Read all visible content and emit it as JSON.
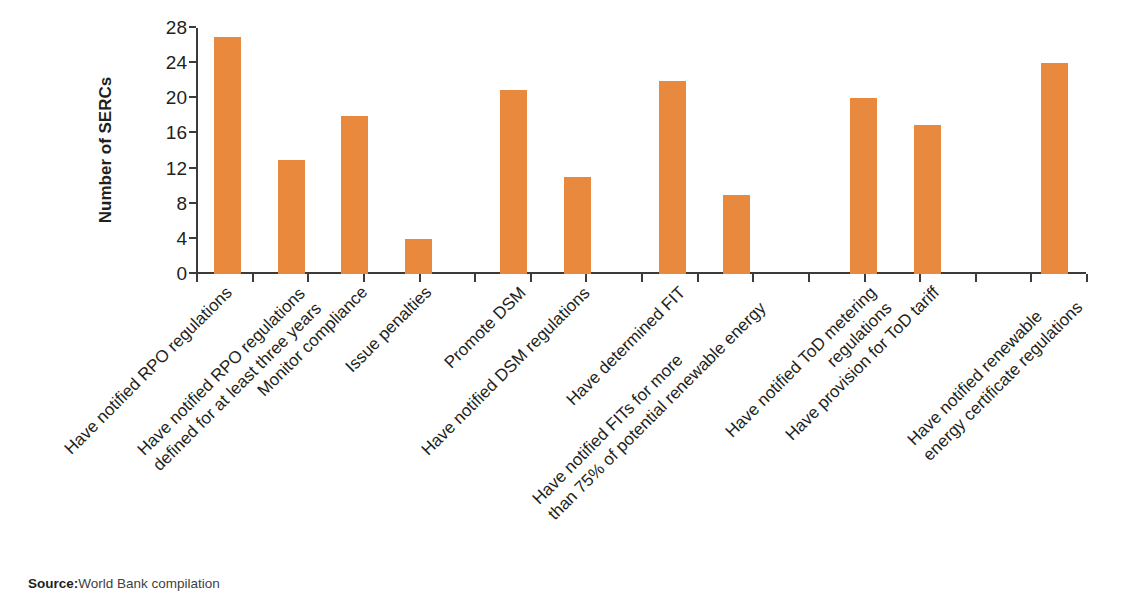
{
  "figure": {
    "source_prefix": "Source:",
    "source_text": "World Bank compilation"
  },
  "chart_data": {
    "type": "bar",
    "title": "",
    "xlabel": "",
    "ylabel": "Number of SERCs",
    "ylim": [
      0,
      28
    ],
    "yticks": [
      0,
      4,
      8,
      12,
      16,
      20,
      24,
      28
    ],
    "grid": false,
    "legend": "none",
    "bar_color": "#e9893d",
    "axis_color": "#3b3b3b",
    "categories": [
      "Have notified RPO regulations",
      "Have notified RPO regulations defined for at least three years",
      "Monitor compliance",
      "Issue penalties",
      "Promote DSM",
      "Have notified DSM regulations",
      "Have determined FIT",
      "Have notified FITs for more than 75% of potential renewable energy",
      "Have notified ToD metering regulations",
      "Have provision for ToD tariff",
      "Have notified renewable energy certificate regulations"
    ],
    "values": [
      27,
      13,
      18,
      4,
      21,
      11,
      22,
      9,
      20,
      17,
      24
    ],
    "category_labels": [
      {
        "line1": "Have notified RPO regulations",
        "line2": ""
      },
      {
        "line1": "Have notified RPO regulations",
        "line2": "defined for at least three years"
      },
      {
        "line1": "Monitor compliance",
        "line2": ""
      },
      {
        "line1": "Issue penalties",
        "line2": ""
      },
      {
        "line1": "Promote DSM",
        "line2": ""
      },
      {
        "line1": "Have notified DSM regulations",
        "line2": ""
      },
      {
        "line1": "Have determined FIT",
        "line2": ""
      },
      {
        "line1": "Have notified FITs for more",
        "line2": "than 75% of potential renewable energy"
      },
      {
        "line1": "Have notified ToD metering",
        "line2": "regulations"
      },
      {
        "line1": "Have provision for ToD tariff",
        "line2": ""
      },
      {
        "line1": "Have notified renewable",
        "line2": "energy certificate regulations"
      }
    ]
  }
}
